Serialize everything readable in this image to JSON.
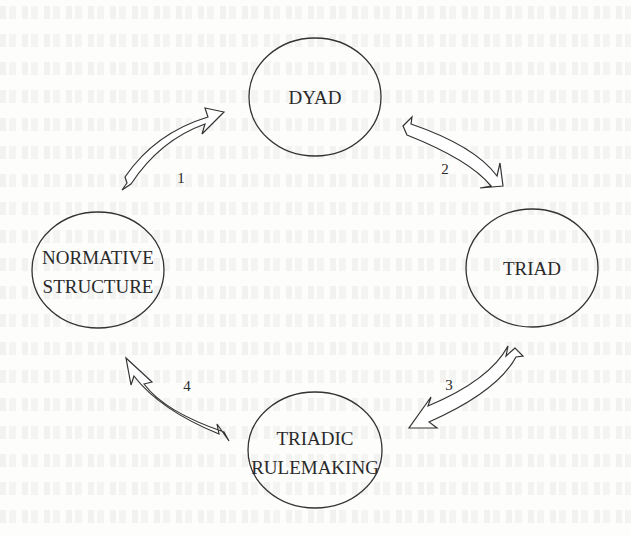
{
  "diagram": {
    "type": "cycle",
    "nodes": [
      {
        "id": "dyad",
        "lines": [
          "DYAD"
        ],
        "cx": 315,
        "cy": 97,
        "rx": 66,
        "ry": 59
      },
      {
        "id": "triad",
        "lines": [
          "TRIAD"
        ],
        "cx": 532,
        "cy": 268,
        "rx": 66,
        "ry": 59
      },
      {
        "id": "triadic-rulemaking",
        "lines": [
          "TRIADIC",
          "RULEMAKING"
        ],
        "cx": 315,
        "cy": 450,
        "rx": 67,
        "ry": 58
      },
      {
        "id": "normative-structure",
        "lines": [
          "NORMATIVE",
          "STRUCTURE"
        ],
        "cx": 98,
        "cy": 270,
        "rx": 66,
        "ry": 58
      }
    ],
    "edges": [
      {
        "label": "1",
        "from": "normative-structure",
        "to": "dyad"
      },
      {
        "label": "2",
        "from": "dyad",
        "to": "triad"
      },
      {
        "label": "3",
        "from": "triad",
        "to": "triadic-rulemaking"
      },
      {
        "label": "4",
        "from": "triadic-rulemaking",
        "to": "normative-structure"
      }
    ],
    "colors": {
      "stroke": "#333333",
      "background": "#fdfdfc",
      "text": "#2a2a2a"
    }
  }
}
